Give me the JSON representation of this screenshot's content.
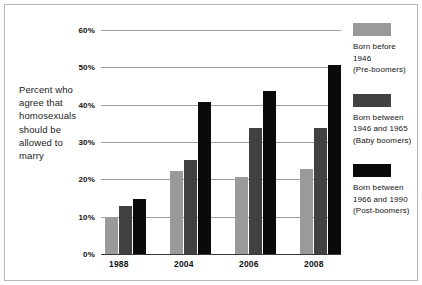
{
  "chart_data": {
    "type": "bar",
    "title": "",
    "xlabel": "",
    "ylabel": "Percent who agree that homosexuals should be allowed to marry",
    "categories": [
      "1988",
      "2004",
      "2006",
      "2008"
    ],
    "series": [
      {
        "name": "Born before 1946 (Pre-boomers)",
        "color": "#9a9a9a",
        "values": [
          10,
          22.5,
          21,
          23
        ]
      },
      {
        "name": "Born between 1946 and 1965 (Baby boomers)",
        "color": "#414141",
        "values": [
          13,
          25.5,
          34,
          34
        ]
      },
      {
        "name": "Born between 1966 and 1990 (Post-boomers)",
        "color": "#0a0a0a",
        "values": [
          15,
          41,
          44,
          51
        ]
      }
    ],
    "ylim": [
      0,
      60
    ],
    "ytick_labels": [
      "0%",
      "10%",
      "20%",
      "30%",
      "40%",
      "50%",
      "60%"
    ],
    "ytick_values": [
      0,
      10,
      20,
      30,
      40,
      50,
      60
    ],
    "grid": true,
    "legend_position": "right"
  },
  "ylabel": {
    "lines": [
      "Percent who",
      "agree that",
      "homosexuals",
      "should be",
      "allowed to",
      "marry"
    ]
  },
  "legend": {
    "entries": [
      {
        "swatch": "s0",
        "lines": [
          "Born before",
          "1946",
          "(Pre-boomers)"
        ]
      },
      {
        "swatch": "s1",
        "lines": [
          "Born between",
          "1946 and 1965",
          "(Baby boomers)"
        ]
      },
      {
        "swatch": "s2",
        "lines": [
          "Born between",
          "1966 and 1990",
          "(Post-boomers)"
        ]
      }
    ]
  }
}
